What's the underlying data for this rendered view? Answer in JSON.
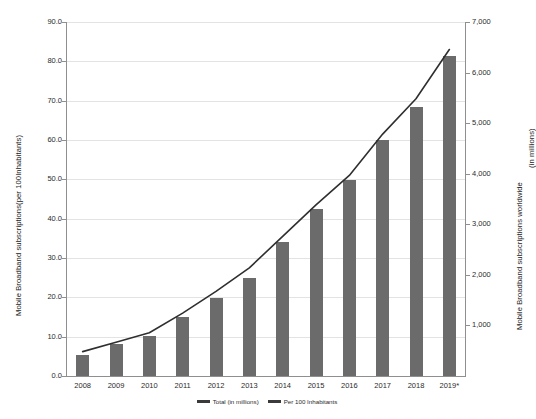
{
  "chart_data": {
    "type": "bar",
    "title": "",
    "subtitle": "",
    "categories": [
      "2008",
      "2009",
      "2010",
      "2011",
      "2012",
      "2013",
      "2014",
      "2015",
      "2016",
      "2017",
      "2018",
      "2019*"
    ],
    "series": [
      {
        "name": "Total (in millions)",
        "kind": "bar",
        "axis": "right",
        "units": "millions",
        "values": [
          422,
          640,
          807,
          1180,
          1550,
          1950,
          2660,
          3320,
          3900,
          4680,
          5340,
          6350
        ]
      },
      {
        "name": "Per 100 Inhabitants",
        "kind": "line",
        "axis": "left",
        "units": "per 100 inhabitants",
        "values": [
          6.2,
          8.6,
          11.0,
          16.0,
          21.5,
          27.5,
          35.5,
          43.5,
          51.0,
          61.5,
          70.5,
          83.0
        ]
      }
    ],
    "bar_values_left_scale": [
      5.4,
      8.2,
      10.3,
      15.1,
      19.8,
      24.9,
      34.0,
      42.5,
      49.9,
      59.9,
      68.3,
      81.3
    ],
    "xlabel": "",
    "ylabel_left": "Mobile Broadband subscriptions(per 100Inhabitants)",
    "ylabel_right": "Mobile Broadband subscriptions worldwide",
    "ylabel_right_units": "(in millions)",
    "ylim_left": [
      0,
      90
    ],
    "ylim_right": [
      0,
      7000
    ],
    "yticks_left": [
      "0.0",
      "10.0",
      "20.0",
      "30.0",
      "40.0",
      "50.0",
      "60.0",
      "70.0",
      "80.0",
      "90.0"
    ],
    "yticks_right": [
      "1,000",
      "2,000",
      "3,000",
      "4,000",
      "5,000",
      "6,000",
      "7,000"
    ],
    "grid": true,
    "legend_position": "bottom-center",
    "colors": {
      "bar": "#6b6b6b",
      "line": "#2f2f2f",
      "grid": "#e3e3e3",
      "axis": "#8f8f8f",
      "background": "#ffffff",
      "text": "#2b2b2b"
    }
  },
  "legend": {
    "items": [
      {
        "label": "Total (in millions)"
      },
      {
        "label": "Per 100 Inhabitants"
      }
    ]
  }
}
